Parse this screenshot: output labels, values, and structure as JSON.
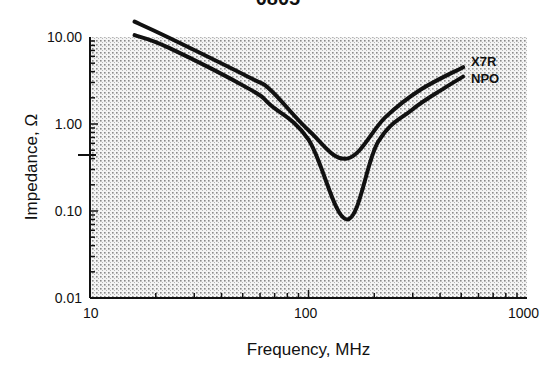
{
  "chart_data": {
    "type": "line",
    "title": "0805",
    "xlabel": "Frequency, MHz",
    "ylabel": "Impedance, Ω",
    "x_scale": "log",
    "y_scale": "log",
    "xlim": [
      10,
      1000
    ],
    "ylim": [
      0.01,
      10
    ],
    "x_ticks": [
      "10",
      "100",
      "1000"
    ],
    "y_ticks": [
      "10.00",
      "1.00",
      "0.10",
      "0.01"
    ],
    "grid": true,
    "legend_position": "right, inline labels at curve ends",
    "series": [
      {
        "name": "X7R",
        "x": [
          16,
          23,
          54,
          67,
          100,
          150,
          225,
          324,
          510
        ],
        "y": [
          15.0,
          9.8,
          3.4,
          2.46,
          0.85,
          0.4,
          1.2,
          2.46,
          4.5
        ]
      },
      {
        "name": "NPO",
        "x": [
          16,
          23,
          54,
          67,
          100,
          150,
          208,
          297,
          420,
          510
        ],
        "y": [
          10.5,
          7.5,
          2.5,
          1.65,
          0.66,
          0.08,
          0.62,
          1.45,
          2.6,
          3.5
        ]
      }
    ]
  },
  "labels": {
    "title": "0805",
    "xlabel": "Frequency, MHz",
    "ylabel": "Impedance, Ω",
    "x_ticks": [
      "10",
      "100",
      "1000"
    ],
    "y_ticks": [
      "10.00",
      "1.00",
      "0.10",
      "0.01"
    ],
    "legend": [
      "X7R",
      "NPO"
    ]
  },
  "colors": {
    "curve": "#111111",
    "plot_background": "#e6e6e6",
    "grid_dots": "#8a8a8a"
  }
}
